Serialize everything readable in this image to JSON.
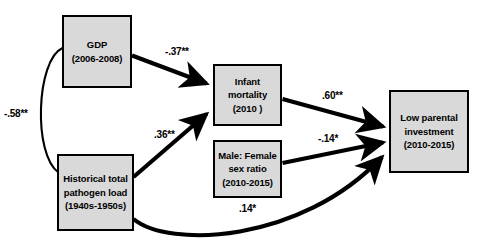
{
  "diagram": {
    "type": "path-analysis-diagram",
    "title": "",
    "nodes": [
      {
        "id": "gdp",
        "name": "gdp",
        "lines": [
          "GDP",
          "(2006-2008)"
        ],
        "x": 62,
        "y": 15,
        "w": 70,
        "h": 73
      },
      {
        "id": "pathogen",
        "name": "historical-pathogen-load",
        "lines": [
          "Historical total",
          "pathogen load",
          "(1940s-1950s)"
        ],
        "x": 57,
        "y": 154,
        "w": 77,
        "h": 77
      },
      {
        "id": "infant",
        "name": "infant-mortality",
        "lines": [
          "Infant",
          "mortality",
          "(2010 )"
        ],
        "x": 213,
        "y": 64,
        "w": 69,
        "h": 62
      },
      {
        "id": "sexratio",
        "name": "male-female-sex-ratio",
        "lines": [
          "Male: Female",
          "sex ratio",
          "(2010-2015)"
        ],
        "x": 213,
        "y": 140,
        "w": 69,
        "h": 58
      },
      {
        "id": "lowparental",
        "name": "low-parental-investment",
        "lines": [
          "Low parental",
          "investment",
          "(2010-2015)"
        ],
        "x": 389,
        "y": 90,
        "w": 80,
        "h": 83
      }
    ],
    "paths": [
      {
        "id": "gdp-pathogen",
        "name": "path-gdp-pathogen-correlation",
        "from": "gdp",
        "to": "pathogen",
        "coefficient": "-.58**",
        "value": -0.58,
        "significance": "**",
        "style": "curved-thin-no-arrow",
        "label_x": 4,
        "label_y": 108
      },
      {
        "id": "gdp-infant",
        "name": "path-gdp-infant-mortality",
        "from": "gdp",
        "to": "infant",
        "coefficient": "-.37**",
        "value": -0.37,
        "significance": "**",
        "style": "straight-thick-arrow",
        "label_x": 165,
        "label_y": 46
      },
      {
        "id": "pathogen-infant",
        "name": "path-pathogen-infant-mortality",
        "from": "pathogen",
        "to": "infant",
        "coefficient": ".36**",
        "value": 0.36,
        "significance": "**",
        "style": "straight-thick-arrow",
        "label_x": 154,
        "label_y": 129
      },
      {
        "id": "infant-lowparental",
        "name": "path-infant-mortality-low-parental-investment",
        "from": "infant",
        "to": "lowparental",
        "coefficient": ".60**",
        "value": 0.6,
        "significance": "**",
        "style": "straight-thick-arrow",
        "label_x": 322,
        "label_y": 90
      },
      {
        "id": "sexratio-lowparental",
        "name": "path-sex-ratio-low-parental-investment",
        "from": "sexratio",
        "to": "lowparental",
        "coefficient": "-.14*",
        "value": -0.14,
        "significance": "*",
        "style": "straight-thick-arrow",
        "label_x": 318,
        "label_y": 133
      },
      {
        "id": "pathogen-lowparental",
        "name": "path-pathogen-low-parental-investment",
        "from": "pathogen",
        "to": "lowparental",
        "coefficient": ".14*",
        "value": 0.14,
        "significance": "*",
        "style": "curved-thick-arrow",
        "label_x": 239,
        "label_y": 203
      }
    ],
    "colors": {
      "box_fill": "#d9d9d9",
      "box_border": "#000000",
      "line": "#000000",
      "text": "#000000",
      "background": "#ffffff"
    }
  }
}
